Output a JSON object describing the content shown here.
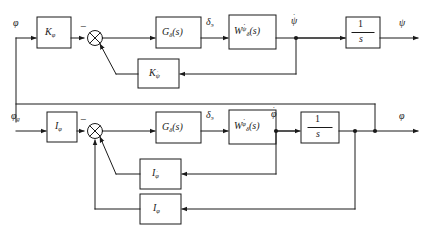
{
  "diagram": {
    "line_color": "#1a1a1a",
    "text_color": "#1a1a1a",
    "background": "#ffffff",
    "top_loop": {
      "input_label": "φ",
      "gain_block": {
        "base": "K",
        "sub": "φ"
      },
      "sum_sign": "−",
      "controller_block": {
        "base": "G",
        "sub": "δ",
        "arg": "(s)"
      },
      "signal_after_controller": {
        "base": "δ",
        "sub": "э"
      },
      "plant_block": {
        "base": "W",
        "sup": "ψ",
        "sup_dot": true,
        "sub": "δ",
        "sub_dot": false,
        "arg": "(s)"
      },
      "signal_after_plant": {
        "base": "ψ",
        "dot": true
      },
      "integrator_block": {
        "numerator": "1",
        "denominator": "s"
      },
      "output_label": "ψ",
      "feedback_block": {
        "base": "K",
        "sub": "ψ",
        "sub_dot": true
      }
    },
    "bottom_loop": {
      "input_label": {
        "base": "φ",
        "sub": "g"
      },
      "gain_block": {
        "base": "I",
        "sub": "φ"
      },
      "sum_sign": "−",
      "controller_block": {
        "base": "G",
        "sub": "δ",
        "arg": "(s)"
      },
      "signal_after_controller": {
        "base": "δ",
        "sub": "э"
      },
      "plant_block": {
        "base": "W",
        "sup": "φ",
        "sup_dot": true,
        "sub": "δ",
        "arg": "(s)"
      },
      "signal_after_plant": {
        "base": "φ",
        "dot": true
      },
      "integrator_block": {
        "numerator": "1",
        "denominator": "s"
      },
      "output_label": "φ",
      "inner_feedback_block": {
        "base": "I",
        "sub": "φ",
        "sub_dot": true
      },
      "outer_feedback_block": {
        "base": "I",
        "sub": "φ",
        "sub_dot": false
      }
    }
  }
}
